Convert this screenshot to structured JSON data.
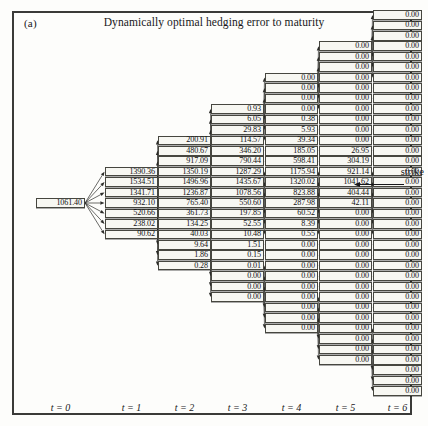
{
  "figure": {
    "panel_label": "(a)",
    "title": "Dynamically optimal hedging error to maturity",
    "annotation": "strike",
    "arrow_icon": "left-arrow-icon"
  },
  "axis": {
    "labels": [
      "t = 0",
      "t = 1",
      "t = 2",
      "t = 3",
      "t = 4",
      "t = 5",
      "t = 6"
    ]
  },
  "chart_data": {
    "type": "tree",
    "title": "Dynamically optimal hedging error to maturity",
    "xlabel": "t",
    "ylabel": "",
    "annotation": "strike",
    "panel": "(a)",
    "steps": [
      "t = 0",
      "t = 1",
      "t = 2",
      "t = 3",
      "t = 4",
      "t = 5",
      "t = 6"
    ],
    "node_counts": [
      1,
      7,
      13,
      19,
      25,
      31,
      37
    ],
    "columns": [
      {
        "step": "t = 0",
        "values": [
          "1061.40"
        ]
      },
      {
        "step": "t = 1",
        "values": [
          "1390.36",
          "1534.51",
          "1341.71",
          "932.10",
          "520.66",
          "238.02",
          "90.62"
        ]
      },
      {
        "step": "t = 2",
        "values": [
          "200.91",
          "480.67",
          "917.09",
          "1350.19",
          "1496.96",
          "1236.87",
          "765.40",
          "361.73",
          "134.25",
          "40.03",
          "9.64",
          "1.86",
          "0.28"
        ]
      },
      {
        "step": "t = 3",
        "values": [
          "0.93",
          "6.05",
          "29.83",
          "114.57",
          "346.20",
          "790.44",
          "1287.29",
          "1435.67",
          "1078.56",
          "550.60",
          "197.85",
          "52.55",
          "10.48",
          "1.51",
          "0.15",
          "0.01",
          "0.00",
          "0.00",
          "0.00"
        ]
      },
      {
        "step": "t = 4",
        "values": [
          "0.00",
          "0.00",
          "0.00",
          "0.00",
          "0.38",
          "5.93",
          "39.34",
          "185.05",
          "598.41",
          "1175.94",
          "1320.02",
          "823.88",
          "287.98",
          "60.52",
          "8.39",
          "0.55",
          "0.00",
          "0.00",
          "0.00",
          "0.00",
          "0.00",
          "0.00",
          "0.00",
          "0.00",
          "0.00"
        ]
      },
      {
        "step": "t = 5",
        "values": [
          "0.00",
          "0.00",
          "0.00",
          "0.00",
          "0.00",
          "0.00",
          "0.00",
          "0.00",
          "0.00",
          "0.00",
          "26.95",
          "304.19",
          "921.14",
          "1041.62",
          "404.44",
          "42.11",
          "0.00",
          "0.00",
          "0.00",
          "0.00",
          "0.00",
          "0.00",
          "0.00",
          "0.00",
          "0.00",
          "0.00",
          "0.00",
          "0.00",
          "0.00",
          "0.00",
          "0.00"
        ]
      },
      {
        "step": "t = 6",
        "values": [
          "0.00",
          "0.00",
          "0.00",
          "0.00",
          "0.00",
          "0.00",
          "0.00",
          "0.00",
          "0.00",
          "0.00",
          "0.00",
          "0.00",
          "0.00",
          "0.00",
          "0.00",
          "0.00",
          "0.00",
          "0.00",
          "0.00",
          "0.00",
          "0.00",
          "0.00",
          "0.00",
          "0.00",
          "0.00",
          "0.00",
          "0.00",
          "0.00",
          "0.00",
          "0.00",
          "0.00",
          "0.00",
          "0.00",
          "0.00",
          "0.00",
          "0.00",
          "0.00"
        ]
      }
    ]
  },
  "colors": {
    "frame": "#3a3a38",
    "node_border": "#46463f",
    "node_fill": "#f7f7f2",
    "text": "#101012",
    "edge": "#2b2b28",
    "background": "#fdfdfb"
  }
}
